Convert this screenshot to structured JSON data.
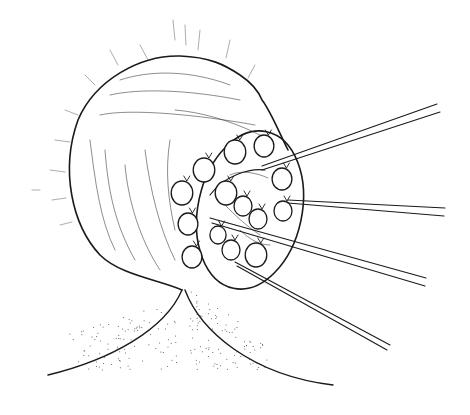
{
  "figure": {
    "colors": {
      "background": "#ffffff",
      "ink": "#1a1a1a"
    },
    "nodules": [
      {
        "cx": 235,
        "cy": 152,
        "r": 12
      },
      {
        "cx": 264,
        "cy": 146,
        "r": 11
      },
      {
        "cx": 204,
        "cy": 170,
        "r": 12
      },
      {
        "cx": 182,
        "cy": 193,
        "r": 12
      },
      {
        "cx": 226,
        "cy": 193,
        "r": 12
      },
      {
        "cx": 282,
        "cy": 179,
        "r": 11
      },
      {
        "cx": 243,
        "cy": 206,
        "r": 10
      },
      {
        "cx": 258,
        "cy": 219,
        "r": 10
      },
      {
        "cx": 283,
        "cy": 211,
        "r": 10
      },
      {
        "cx": 188,
        "cy": 224,
        "r": 11
      },
      {
        "cx": 218,
        "cy": 235,
        "r": 9
      },
      {
        "cx": 231,
        "cy": 250,
        "r": 10
      },
      {
        "cx": 192,
        "cy": 257,
        "r": 11
      },
      {
        "cx": 256,
        "cy": 255,
        "r": 12
      }
    ],
    "sutures": [
      {
        "x1": 262,
        "y1": 166,
        "x2": 437,
        "y2": 104
      },
      {
        "x1": 262,
        "y1": 170,
        "x2": 440,
        "y2": 112
      },
      {
        "x1": 288,
        "y1": 200,
        "x2": 445,
        "y2": 208
      },
      {
        "x1": 288,
        "y1": 203,
        "x2": 444,
        "y2": 216
      },
      {
        "x1": 210,
        "y1": 218,
        "x2": 426,
        "y2": 278
      },
      {
        "x1": 212,
        "y1": 223,
        "x2": 425,
        "y2": 286
      },
      {
        "x1": 235,
        "y1": 262,
        "x2": 390,
        "y2": 345
      },
      {
        "x1": 237,
        "y1": 266,
        "x2": 387,
        "y2": 350
      }
    ]
  }
}
